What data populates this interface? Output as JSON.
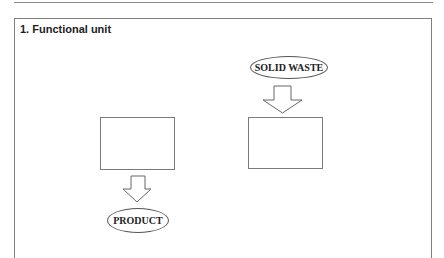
{
  "section": {
    "title": "1. Functional unit"
  },
  "diagram": {
    "left_process": {
      "label": ""
    },
    "right_process": {
      "label": ""
    },
    "input_label": "SOLID WASTE",
    "output_label": "PRODUCT",
    "arrows": [
      {
        "from": "SOLID WASTE",
        "to": "right_process",
        "direction": "down"
      },
      {
        "from": "left_process",
        "to": "PRODUCT",
        "direction": "down"
      }
    ]
  }
}
